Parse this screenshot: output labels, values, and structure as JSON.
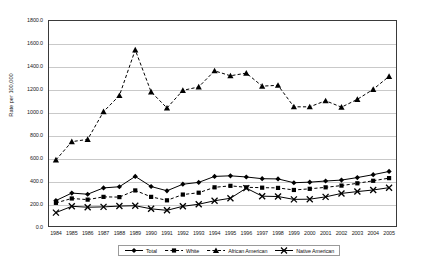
{
  "chart_data": {
    "type": "line",
    "title": "",
    "xlabel": "",
    "ylabel": "Rate per 100,000",
    "ylim": [
      0,
      1800
    ],
    "y_ticks": [
      "0.0",
      "200.0",
      "400.0",
      "600.0",
      "800.0",
      "1000.0",
      "1200.0",
      "1400.0",
      "1600.0",
      "1800.0"
    ],
    "y_tick_values": [
      0,
      200,
      400,
      600,
      800,
      1000,
      1200,
      1400,
      1600,
      1800
    ],
    "grid": true,
    "legend_position": "bottom",
    "categories": [
      "1984",
      "1985",
      "1986",
      "1987",
      "1988",
      "1989",
      "1990",
      "1991",
      "1992",
      "1993",
      "1994",
      "1995",
      "1996",
      "1997",
      "1998",
      "1999",
      "2000",
      "2001",
      "2002",
      "2003",
      "2004",
      "2005"
    ],
    "series": [
      {
        "name": "Total",
        "marker": "diamond",
        "line_style": "solid",
        "color": "#000000",
        "values": [
          230,
          295,
          285,
          340,
          350,
          440,
          352,
          315,
          372,
          388,
          440,
          445,
          435,
          420,
          418,
          385,
          390,
          400,
          408,
          430,
          455,
          483
        ]
      },
      {
        "name": "White",
        "marker": "square",
        "line_style": "dashed",
        "color": "#000000",
        "values": [
          210,
          248,
          238,
          262,
          260,
          318,
          262,
          232,
          282,
          298,
          345,
          358,
          345,
          342,
          340,
          322,
          332,
          345,
          360,
          380,
          402,
          425
        ]
      },
      {
        "name": "African American",
        "marker": "triangle",
        "line_style": "dashed",
        "color": "#000000",
        "values": [
          583,
          742,
          762,
          1003,
          1143,
          1540,
          1175,
          1035,
          1188,
          1218,
          1358,
          1315,
          1338,
          1225,
          1232,
          1045,
          1045,
          1098,
          1042,
          1110,
          1197,
          1310
        ]
      },
      {
        "name": "Native American",
        "marker": "cross",
        "line_style": "solid",
        "color": "#000000",
        "values": [
          125,
          180,
          172,
          175,
          182,
          185,
          158,
          145,
          180,
          198,
          228,
          250,
          338,
          268,
          265,
          240,
          242,
          262,
          292,
          308,
          322,
          342
        ]
      }
    ]
  },
  "legend": {
    "items": [
      {
        "label": "Total"
      },
      {
        "label": "White"
      },
      {
        "label": "African American"
      },
      {
        "label": "Native American"
      }
    ]
  }
}
